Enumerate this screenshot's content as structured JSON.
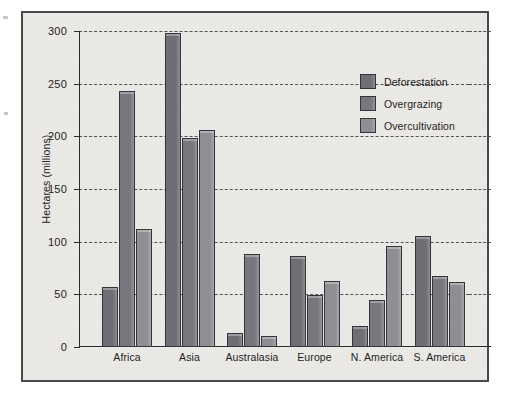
{
  "chart_data": {
    "type": "bar",
    "title": "",
    "xlabel": "",
    "ylabel": "Hectares (millions)",
    "ylim": [
      0,
      300
    ],
    "yticks": [
      0,
      50,
      100,
      150,
      200,
      250,
      300
    ],
    "ytick_labels": [
      "0",
      "50",
      "100",
      "150",
      "200",
      "250",
      "300"
    ],
    "grid": "horizontal-dashed",
    "legend_position": "upper-right-inside",
    "categories": [
      "Africa",
      "Asia",
      "Australasia",
      "Europe",
      "N. America",
      "S. America"
    ],
    "series": [
      {
        "name": "Deforestation",
        "color": "#6e6e74",
        "values": [
          57,
          298,
          13,
          86,
          20,
          105
        ]
      },
      {
        "name": "Overgrazing",
        "color": "#77777d",
        "values": [
          243,
          198,
          88,
          49,
          45,
          67
        ]
      },
      {
        "name": "Overcultivation",
        "color": "#8e8e93",
        "values": [
          112,
          206,
          10,
          63,
          96,
          62
        ]
      }
    ]
  },
  "legend": {
    "items": [
      {
        "label": "Deforestation",
        "color": "#6e6e74"
      },
      {
        "label": "Overgrazing",
        "color": "#77777d"
      },
      {
        "label": "Overcultivation",
        "color": "#8e8e93"
      }
    ]
  },
  "colors": {
    "frame_border": "#4a4a4a",
    "plot_background": "#eceae6",
    "axis": "#2b2b2b",
    "gridline": "#3a3a3a",
    "text": "#1d1d1d"
  }
}
